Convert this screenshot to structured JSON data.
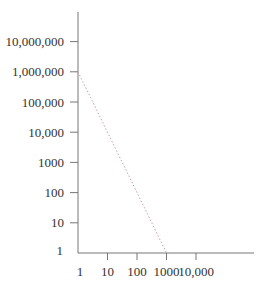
{
  "chart_data": {
    "type": "line",
    "title": "",
    "xlabel": "",
    "ylabel": "",
    "x_scale": "log",
    "y_scale": "log",
    "x_ticks": [
      "1",
      "10",
      "100",
      "1000",
      "10,000"
    ],
    "y_ticks": [
      "1",
      "10",
      "100",
      "1000",
      "10,000",
      "100,000",
      "1,000,000",
      "10,000,000"
    ],
    "xlim": [
      1,
      100000
    ],
    "ylim": [
      1,
      100000000
    ],
    "grid": false,
    "legend": null,
    "series": [
      {
        "name": "dotted line",
        "style": "dotted",
        "color": "#c9a0a8",
        "x": [
          1,
          1000
        ],
        "y": [
          1000000,
          1
        ]
      }
    ]
  },
  "colors": {
    "axis": "#777777",
    "text": "#333333",
    "line": "#c9a0a8"
  }
}
